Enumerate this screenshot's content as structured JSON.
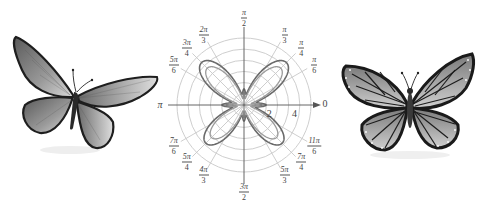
{
  "figure": {
    "polar_plot": {
      "center": [
        244,
        105
      ],
      "outer_radius": 67,
      "circle_count": 6,
      "radial_tick_labels": [
        {
          "text": "2",
          "r": 2
        },
        {
          "text": "4",
          "r": 4
        }
      ],
      "angle_labels": [
        {
          "id": "a0",
          "num": "",
          "den": "",
          "plain": "0",
          "angle_deg": 0
        },
        {
          "id": "a30",
          "num": "π",
          "den": "6",
          "angle_deg": 30
        },
        {
          "id": "a45",
          "num": "π",
          "den": "4",
          "angle_deg": 45
        },
        {
          "id": "a60",
          "num": "π",
          "den": "3",
          "angle_deg": 60
        },
        {
          "id": "a90",
          "num": "π",
          "den": "2",
          "angle_deg": 90
        },
        {
          "id": "a120",
          "num": "2π",
          "den": "3",
          "angle_deg": 120
        },
        {
          "id": "a135",
          "num": "3π",
          "den": "4",
          "angle_deg": 135
        },
        {
          "id": "a150",
          "num": "5π",
          "den": "6",
          "angle_deg": 150
        },
        {
          "id": "a180",
          "num": "",
          "den": "",
          "plain": "π",
          "angle_deg": 180
        },
        {
          "id": "a210",
          "num": "7π",
          "den": "6",
          "angle_deg": 210
        },
        {
          "id": "a225",
          "num": "5π",
          "den": "4",
          "angle_deg": 225
        },
        {
          "id": "a240",
          "num": "4π",
          "den": "3",
          "angle_deg": 240
        },
        {
          "id": "a270",
          "num": "3π",
          "den": "2",
          "angle_deg": 270
        },
        {
          "id": "a300",
          "num": "5π",
          "den": "3",
          "angle_deg": 300
        },
        {
          "id": "a315",
          "num": "7π",
          "den": "4",
          "angle_deg": 315
        },
        {
          "id": "a330",
          "num": "11π",
          "den": "6",
          "angle_deg": 330
        }
      ],
      "curves": [
        {
          "name": "outer-butterfly-curve",
          "color": "#6a6a6a"
        },
        {
          "name": "inner-butterfly-curve",
          "color": "#8a8a8a"
        }
      ]
    },
    "left_butterfly": {
      "style": "grayscale swallowtail-like with dark wing borders"
    },
    "right_butterfly": {
      "style": "grayscale monarch with black veins and white-dotted borders"
    },
    "colors": {
      "grid": "#c8c8c8",
      "axis": "#555555",
      "curve_dark": "#6a6a6a",
      "curve_light": "#9a9a9a",
      "label": "#444444"
    }
  }
}
